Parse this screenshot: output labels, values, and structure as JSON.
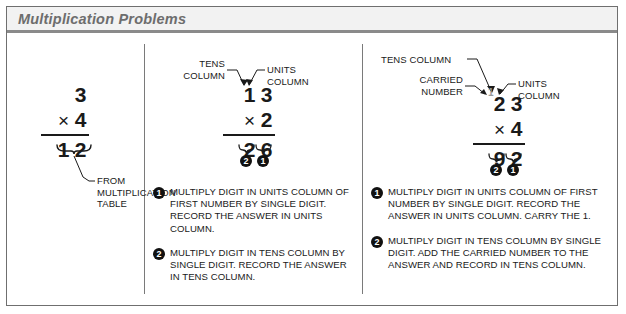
{
  "title": "Multiplication Problems",
  "colors": {
    "frame": "#6f6f6f",
    "banner_bg": "#f2f2f2",
    "banner_rule": "#8a8a8a",
    "title_text": "#6d6d6d",
    "ink": "#1a1a1a",
    "carried_digit": "#9a9a9a",
    "badge_bg": "#111111"
  },
  "columns": [
    {
      "id": "single-digit",
      "problem": {
        "multiplicand": [
          "3"
        ],
        "operator": "×",
        "multiplier": [
          "4"
        ],
        "product": [
          "1",
          "2"
        ]
      },
      "callouts": [
        {
          "name": "from-multiplication-table",
          "text": "FROM\nMULTIPLICATION\nTABLE"
        }
      ],
      "steps": []
    },
    {
      "id": "two-digit-no-carry",
      "problem": {
        "multiplicand": [
          "1",
          "3"
        ],
        "operator": "×",
        "multiplier": [
          "2"
        ],
        "product": [
          "2",
          "6"
        ]
      },
      "callouts": [
        {
          "name": "tens-column",
          "text": "TENS\nCOLUMN"
        },
        {
          "name": "units-column",
          "text": "UNITS\nCOLUMN"
        }
      ],
      "badges": [
        "2",
        "1"
      ],
      "steps": [
        {
          "number": "1",
          "text": "MULTIPLY DIGIT IN UNITS COLUMN OF FIRST NUMBER BY SINGLE DIGIT. RECORD THE ANSWER IN UNITS COLUMN."
        },
        {
          "number": "2",
          "text": "MULTIPLY DIGIT IN TENS COLUMN BY SINGLE DIGIT. RECORD THE ANSWER IN TENS COLUMN."
        }
      ]
    },
    {
      "id": "two-digit-with-carry",
      "problem": {
        "carried": "1",
        "multiplicand": [
          "2",
          "3"
        ],
        "operator": "×",
        "multiplier": [
          "4"
        ],
        "product": [
          "9",
          "2"
        ]
      },
      "callouts": [
        {
          "name": "tens-column",
          "text": "TENS COLUMN"
        },
        {
          "name": "carried-number",
          "text": "CARRIED\nNUMBER"
        },
        {
          "name": "units-column",
          "text": "UNITS\nCOLUMN"
        }
      ],
      "badges": [
        "2",
        "1"
      ],
      "steps": [
        {
          "number": "1",
          "text": "MULTIPLY DIGIT IN UNITS COLUMN OF FIRST NUMBER BY SINGLE DIGIT.  RECORD THE ANSWER IN UNITS COLUMN. CARRY THE 1."
        },
        {
          "number": "2",
          "text": "MULTIPLY DIGIT IN TENS COLUMN BY SINGLE DIGIT. ADD THE CARRIED NUMBER TO THE ANSWER AND RECORD IN TENS COLUMN."
        }
      ]
    }
  ]
}
